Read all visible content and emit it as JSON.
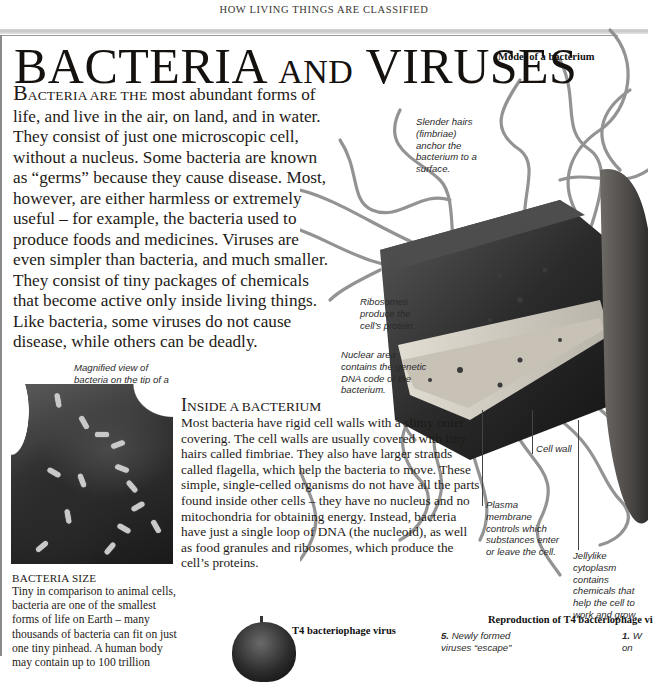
{
  "running_head": "HOW LIVING THINGS ARE CLASSIFIED",
  "title": {
    "part1_cap": "B",
    "part1_rest": "ACTERIA",
    "part2": "AND",
    "part3": "VIRUSES"
  },
  "intro": {
    "lead_cap": "B",
    "lead_smallcaps": "ACTERIA ARE THE",
    "text": " most abundant forms of life, and live in the air, on land, and in water. They consist of just one microscopic cell, without a nucleus. Some bacteria are known as “germs” because they cause disease. Most, however, are either harmless or extremely useful – for example, the bacteria used to produce foods and medicines. Viruses are even simpler than bacteria, and much smaller. They consist of tiny packages of chemicals that become active only inside living things. Like bacteria, some viruses do not cause disease, while others can be deadly."
  },
  "model": {
    "caption": "Model of a bacterium",
    "labels": {
      "fimbriae": "Slender hairs (fimbriae) anchor the bacterium to a surface.",
      "ribosomes": "Ribosomes produce the cell’s protein.",
      "nuclear_area": "Nuclear area contains the genetic DNA code of the bacterium.",
      "cell_wall": "Cell wall",
      "plasma_membrane": "Plasma membrane controls which substances enter or leave the cell.",
      "cytoplasm": "Jellylike cytoplasm contains chemicals that help the cell to work and grow."
    },
    "colors": {
      "body": "#2a2a2a",
      "flagella": "#8c8c8c",
      "cutaway": "#cfcac2"
    }
  },
  "sem_photo": {
    "caption": "Magnified view of bacteria on the tip of a syringe"
  },
  "inside_section": {
    "title_cap": "I",
    "title_rest": "NSIDE A BACTERIUM",
    "body": "Most bacteria have rigid cell walls with a slimy outer covering. The cell walls are usually covered with tiny hairs called fimbriae. They also have larger strands called flagella, which help the bacteria to move. These simple, single-celled organisms do not have all the parts found inside other cells – they have no nucleus and no mitochondria for obtaining energy. Instead, bacteria have just a single loop of DNA (the nucleoid), as well as food granules and ribosomes, which produce the cell’s proteins."
  },
  "size_section": {
    "title": "BACTERIA SIZE",
    "body": "Tiny in comparison to animal cells, bacteria are one of the smallest forms of life on Earth – many thousands of bacteria can fit on just one tiny pinhead. A human body may contain up to 100 trillion"
  },
  "t4_virus": {
    "caption": "T4 bacteriophage virus"
  },
  "reproduction": {
    "caption": "Reproduction of T4 bacteriophage vi",
    "step5_num": "5.",
    "step5_text": " Newly formed viruses “escape”",
    "step1_num": "1.",
    "step1_text": " W on"
  }
}
